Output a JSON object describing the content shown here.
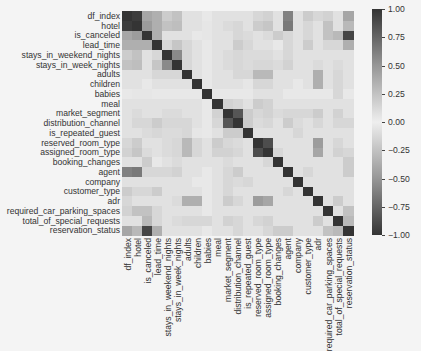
{
  "chart_data": {
    "type": "heatmap",
    "title": "",
    "xlabel": "",
    "ylabel": "",
    "labels": [
      "df_index",
      "hotel",
      "is_canceled",
      "lead_time",
      "stays_in_weekend_nights",
      "stays_in_week_nights",
      "adults",
      "children",
      "babies",
      "meal",
      "market_segment",
      "distribution_channel",
      "is_repeated_guest",
      "reserved_room_type",
      "assigned_room_type",
      "booking_changes",
      "agent",
      "company",
      "customer_type",
      "adr",
      "required_car_parking_spaces",
      "total_of_special_requests",
      "reservation_status"
    ],
    "colorbar": {
      "min": -1.0,
      "max": 1.0,
      "ticks": [
        "1.00",
        "0.75",
        "0.50",
        "0.25",
        "0.00",
        "−0.25",
        "−0.50",
        "−0.75",
        "−1.00"
      ]
    },
    "upper_triangle_values": [
      [
        1.0,
        0.95,
        0.35,
        0.3,
        0.15,
        0.2,
        0.05,
        0.05,
        0.02,
        0.05,
        0.05,
        0.05,
        0.05,
        0.1,
        0.12,
        0.05,
        0.55,
        0.05,
        0.15,
        0.1,
        0.12,
        0.05,
        0.35
      ],
      [
        1.0,
        0.4,
        0.3,
        0.2,
        0.22,
        0.05,
        0.05,
        0.03,
        0.05,
        0.08,
        0.1,
        0.05,
        0.15,
        0.18,
        0.05,
        0.6,
        0.05,
        0.1,
        0.05,
        0.2,
        0.05,
        0.25
      ],
      [
        1.0,
        0.3,
        0.05,
        0.05,
        0.05,
        0.02,
        0.03,
        0.05,
        0.05,
        0.1,
        0.08,
        0.05,
        0.08,
        0.15,
        0.1,
        0.05,
        0.1,
        0.05,
        0.2,
        0.25,
        0.9
      ],
      [
        1.0,
        0.1,
        0.18,
        0.1,
        0.05,
        0.02,
        0.05,
        0.05,
        0.15,
        0.1,
        0.05,
        0.05,
        0.02,
        0.1,
        0.05,
        0.15,
        0.05,
        0.1,
        0.1,
        0.3
      ],
      [
        1.0,
        0.5,
        0.1,
        0.05,
        0.02,
        0.05,
        0.08,
        0.1,
        0.08,
        0.08,
        0.08,
        0.05,
        0.1,
        0.05,
        0.05,
        0.05,
        0.05,
        0.05,
        0.05
      ],
      [
        1.0,
        0.1,
        0.05,
        0.02,
        0.05,
        0.08,
        0.1,
        0.08,
        0.1,
        0.1,
        0.08,
        0.12,
        0.05,
        0.05,
        0.08,
        0.05,
        0.08,
        0.05
      ],
      [
        1.0,
        0.05,
        0.02,
        0.05,
        0.05,
        0.1,
        0.1,
        0.25,
        0.25,
        0.05,
        0.05,
        0.05,
        0.05,
        0.3,
        0.05,
        0.1,
        0.05
      ],
      [
        1.0,
        0.02,
        0.05,
        0.05,
        0.05,
        0.03,
        0.1,
        0.1,
        0.05,
        0.05,
        0.02,
        0.05,
        0.3,
        0.05,
        0.1,
        0.05
      ],
      [
        1.0,
        0.02,
        0.02,
        0.02,
        0.02,
        0.05,
        0.05,
        0.05,
        0.02,
        0.02,
        0.02,
        0.02,
        0.02,
        0.1,
        0.02
      ],
      [
        1.0,
        0.12,
        0.1,
        0.05,
        0.15,
        0.12,
        0.05,
        0.05,
        0.05,
        0.05,
        0.05,
        0.05,
        0.05,
        0.05
      ],
      [
        1.0,
        0.8,
        0.15,
        0.1,
        0.12,
        0.08,
        0.1,
        0.1,
        0.1,
        0.15,
        0.05,
        0.12,
        0.05
      ],
      [
        1.0,
        0.15,
        0.08,
        0.1,
        0.05,
        0.15,
        0.08,
        0.05,
        0.1,
        0.05,
        0.1,
        0.1
      ],
      [
        1.0,
        0.05,
        0.05,
        0.05,
        0.05,
        0.1,
        0.05,
        0.05,
        0.05,
        0.05,
        0.05
      ],
      [
        1.0,
        0.85,
        0.05,
        0.05,
        0.05,
        0.05,
        0.4,
        0.05,
        0.1,
        0.05
      ],
      [
        1.0,
        0.1,
        0.05,
        0.05,
        0.05,
        0.35,
        0.05,
        0.12,
        0.1
      ],
      [
        1.0,
        0.05,
        0.05,
        0.05,
        0.05,
        0.05,
        0.05,
        0.15
      ],
      [
        1.0,
        0.05,
        0.1,
        0.05,
        0.05,
        0.05,
        0.15
      ],
      [
        1.0,
        0.05,
        0.05,
        0.05,
        0.05,
        0.05
      ],
      [
        1.0,
        0.05,
        0.05,
        0.05,
        0.05
      ],
      [
        1.0,
        0.05,
        0.15,
        0.05
      ],
      [
        1.0,
        0.05,
        0.2
      ],
      [
        1.0,
        0.25
      ],
      [
        1.0
      ]
    ],
    "grid": false,
    "legend_position": "right-colorbar"
  }
}
